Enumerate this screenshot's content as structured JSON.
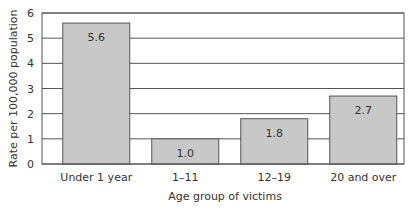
{
  "chart_data": {
    "type": "bar",
    "title": "",
    "xlabel": "Age group of victims",
    "ylabel": "Rate per 100,000 population",
    "categories": [
      "Under 1 year",
      "1–11",
      "12–19",
      "20 and over"
    ],
    "values": [
      5.6,
      1.0,
      1.8,
      2.7
    ],
    "value_labels": [
      "5.6",
      "1.0",
      "1.8",
      "2.7"
    ],
    "ylim": [
      0,
      6
    ],
    "yticks": [
      0,
      1,
      2,
      3,
      4,
      5,
      6
    ],
    "grid": true,
    "legend": null
  },
  "colors": {
    "bar_fill": "#c8c8c8",
    "bar_stroke": "#555555",
    "grid": "#555555",
    "axis": "#555555"
  }
}
